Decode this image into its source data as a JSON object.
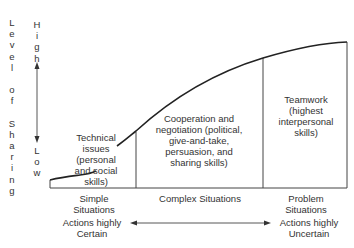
{
  "diagram": {
    "y_axis": {
      "title": "Level of Sharing",
      "high_label": "High",
      "low_label": "Low"
    },
    "regions": [
      {
        "id": "simple",
        "label": "Simple Situations",
        "line1": "Simple",
        "line2": "Situations",
        "description_lines": [
          "Technical",
          "issues",
          "(personal",
          "and social",
          "skills)"
        ]
      },
      {
        "id": "complex",
        "label": "Complex Situations",
        "description_lines": [
          "Cooperation and",
          "negotiation (political,",
          "give-and-take,",
          "persuasion, and",
          "sharing skills)"
        ]
      },
      {
        "id": "problem",
        "label": "Problem Situations",
        "line1": "Problem",
        "line2": "Situations",
        "description_lines": [
          "Teamwork",
          "(highest",
          "interpersonal",
          "skills)"
        ]
      }
    ],
    "x_axis": {
      "left_line1": "Actions highly",
      "left_line2": "Certain",
      "right_line1": "Actions highly",
      "right_line2": "Uncertain"
    }
  }
}
